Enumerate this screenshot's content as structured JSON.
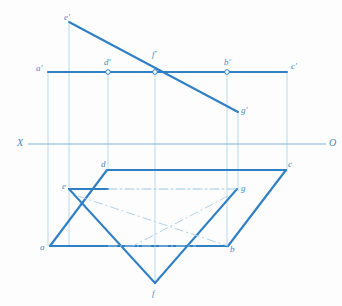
{
  "figure": {
    "background_color": "#fdfdfd",
    "line_color_heavy": "#2e7fc4",
    "line_color_light": "#9dc9e8",
    "label_color": "#4a87bd",
    "ground_line": {
      "left_label": "X",
      "right_label": "O",
      "y": 144,
      "x_start": 28,
      "x_end": 326
    },
    "labels": [
      {
        "id": "e-prime",
        "text": "e'",
        "x": 64,
        "y": 13
      },
      {
        "id": "f-prime",
        "text": "f'",
        "x": 152,
        "y": 50
      },
      {
        "id": "d-prime",
        "text": "d'",
        "x": 104,
        "y": 58
      },
      {
        "id": "b-prime",
        "text": "b'",
        "x": 224,
        "y": 58
      },
      {
        "id": "a-prime",
        "text": "a'",
        "x": 36,
        "y": 64
      },
      {
        "id": "c-prime",
        "text": "c'",
        "x": 291,
        "y": 62
      },
      {
        "id": "g-prime",
        "text": "g'",
        "x": 241,
        "y": 106
      },
      {
        "id": "x-axis",
        "text": "X",
        "x": 17,
        "y": 138
      },
      {
        "id": "o-axis",
        "text": "O",
        "x": 329,
        "y": 138
      },
      {
        "id": "d-point",
        "text": "d",
        "x": 101,
        "y": 160
      },
      {
        "id": "c-point",
        "text": "c",
        "x": 288,
        "y": 160
      },
      {
        "id": "e-point",
        "text": "e",
        "x": 62,
        "y": 182
      },
      {
        "id": "g-point",
        "text": "g",
        "x": 241,
        "y": 184
      },
      {
        "id": "a-point",
        "text": "a",
        "x": 40,
        "y": 243
      },
      {
        "id": "b-point",
        "text": "b",
        "x": 230,
        "y": 245
      },
      {
        "id": "f-point",
        "text": "f",
        "x": 152,
        "y": 289
      }
    ],
    "points": {
      "e_prime": {
        "x": 69,
        "y": 22
      },
      "f_prime": {
        "x": 155,
        "y": 72
      },
      "g_prime": {
        "x": 238,
        "y": 112
      },
      "a_prime": {
        "x": 48,
        "y": 72
      },
      "d_prime": {
        "x": 108,
        "y": 72
      },
      "b_prime": {
        "x": 227,
        "y": 72
      },
      "c_prime": {
        "x": 287,
        "y": 72
      },
      "a": {
        "x": 50,
        "y": 246
      },
      "b": {
        "x": 228,
        "y": 246
      },
      "c": {
        "x": 286,
        "y": 170
      },
      "d": {
        "x": 107,
        "y": 170
      },
      "e": {
        "x": 69,
        "y": 189
      },
      "f": {
        "x": 155,
        "y": 283
      },
      "g": {
        "x": 237,
        "y": 189
      }
    },
    "markers": [
      {
        "id": "marker-d-prime",
        "x": 108,
        "y": 72
      },
      {
        "id": "marker-f-prime",
        "x": 155,
        "y": 72
      },
      {
        "id": "marker-b-prime",
        "x": 227,
        "y": 72
      }
    ],
    "edges": {
      "front_view_plane": "a'(48,72) - c'(287,72) horizontal edge with verticals down to ground line",
      "front_view_line": "e'(69,22) - g'(238,112) straight inclined line crossing f'(155,72)",
      "top_view_plane": "a(50,246) - b(228,246) - c(286,170) - d(107,170) closed parallelogram",
      "top_view_triangle": "e(69,189) - f(155,283) - g(237,189) triangle"
    }
  }
}
